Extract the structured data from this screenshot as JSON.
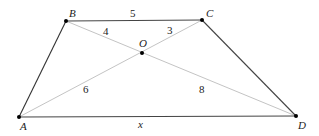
{
  "figure": {
    "type": "trapezoid-with-diagonals",
    "vertices": {
      "A": {
        "label": "A",
        "x": 19,
        "y": 117
      },
      "B": {
        "label": "B",
        "x": 66,
        "y": 21
      },
      "C": {
        "label": "C",
        "x": 202,
        "y": 20
      },
      "D": {
        "label": "D",
        "x": 296,
        "y": 116
      },
      "O": {
        "label": "O",
        "x": 142,
        "y": 53
      }
    },
    "segments": {
      "BC": "5",
      "BO": "4",
      "OC": "3",
      "AO": "6",
      "OD": "8",
      "AD": "x"
    },
    "colors": {
      "side": "#333333",
      "diagonal": "#bdbdbd",
      "point": "#000000"
    }
  }
}
